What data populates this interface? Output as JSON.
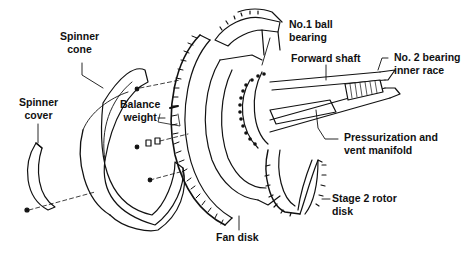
{
  "diagram": {
    "type": "exploded-view technical illustration",
    "colors": {
      "ink": "#111111",
      "background": "#ffffff"
    },
    "labels": [
      {
        "id": "spinner-cone",
        "lines": [
          "Spinner",
          "cone"
        ]
      },
      {
        "id": "spinner-cover",
        "lines": [
          "Spinner",
          "cover"
        ]
      },
      {
        "id": "balance-weight",
        "lines": [
          "Balance",
          "weight"
        ]
      },
      {
        "id": "no1-ball-bearing",
        "lines": [
          "No.1 ball",
          "bearing"
        ]
      },
      {
        "id": "forward-shaft",
        "lines": [
          "Forward shaft"
        ]
      },
      {
        "id": "no2-bearing-inner-race",
        "lines": [
          "No. 2 bearing",
          "inner race"
        ]
      },
      {
        "id": "pressurization-vent-manifold",
        "lines": [
          "Pressurization and",
          "vent manifold"
        ]
      },
      {
        "id": "stage2-rotor-disk",
        "lines": [
          "Stage 2 rotor",
          "disk"
        ]
      },
      {
        "id": "fan-disk",
        "lines": [
          "Fan disk"
        ]
      }
    ]
  }
}
